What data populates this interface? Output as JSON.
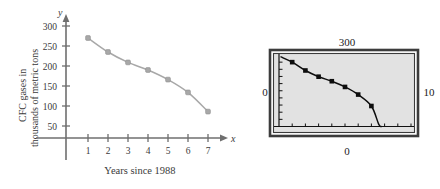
{
  "figure": {
    "left_plot": {
      "y_axis": {
        "letter": "y",
        "label_line1": "CFC gases in",
        "label_line2": "thousands of metric tons",
        "ticks": [
          "50",
          "100",
          "150",
          "200",
          "250",
          "300"
        ]
      },
      "x_axis": {
        "letter": "x",
        "caption": "Years since 1988",
        "ticks": [
          "1",
          "2",
          "3",
          "4",
          "5",
          "6",
          "7"
        ]
      },
      "curve_color": "#a8a8a8",
      "axis_color": "#6f6f6f"
    },
    "calculator": {
      "label_top": "300",
      "label_left": "0",
      "label_right": "10",
      "label_bottom": "0",
      "screen_color": "#e2e2e2",
      "frame_color": "#3c3c3c",
      "curve_color": "#0d0d0d"
    }
  },
  "chart_data": {
    "type": "scatter",
    "title": "",
    "xlabel": "Years since 1988",
    "ylabel": "CFC gases in thousands of metric tons",
    "x": [
      1,
      2,
      3,
      4,
      5,
      6,
      7
    ],
    "values": [
      270,
      235,
      209,
      190,
      166,
      134,
      86
    ],
    "xlim": [
      0,
      8
    ],
    "ylim": [
      0,
      320
    ],
    "xticks": [
      1,
      2,
      3,
      4,
      5,
      6,
      7
    ],
    "yticks": [
      50,
      100,
      150,
      200,
      250,
      300
    ],
    "grid": false,
    "legend": "none",
    "series": [
      {
        "name": "CFC gases",
        "values": [
          270,
          235,
          209,
          190,
          166,
          134,
          86
        ]
      }
    ],
    "calculator_view": {
      "type": "scatter",
      "xlim": [
        0,
        10
      ],
      "ylim": [
        0,
        300
      ],
      "x": [
        1,
        2,
        3,
        4,
        5,
        6,
        7
      ],
      "values": [
        270,
        235,
        209,
        190,
        166,
        134,
        86
      ],
      "xscl_label": "10",
      "yscl_label": "300",
      "origin_label": "0"
    }
  }
}
